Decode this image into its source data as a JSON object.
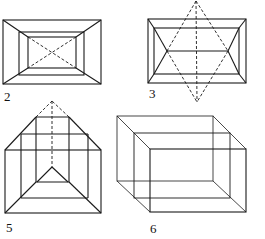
{
  "figures": [
    {
      "id": "fig2",
      "label": "2",
      "description": "Three nested rectangles with corner diagonals; dashed X across innermost rectangle"
    },
    {
      "id": "fig3",
      "label": "3",
      "description": "Nested rectangles with dashed six-pointed star (two overlapping triangles) and central dashed vertical axis"
    },
    {
      "id": "fig5",
      "label": "5",
      "description": "Stepped frame converging to dashed apex with dashed vertical center line"
    },
    {
      "id": "fig6",
      "label": "6",
      "description": "Three staggered rectangles connected at corners forming a box in perspective"
    }
  ],
  "colors": {
    "line": "#1a1a1a",
    "background": "#ffffff"
  }
}
